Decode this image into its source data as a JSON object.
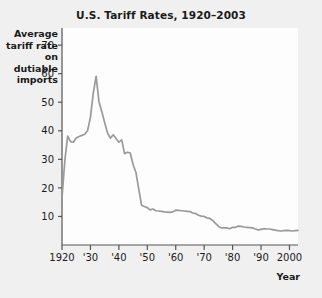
{
  "figure": {
    "background_color": "#f0f0f0",
    "plot_background_color": "#fdfdfd",
    "axis_color": "#555555",
    "line_color": "#9a9a9a"
  },
  "chart_data": {
    "type": "line",
    "title": "U.S. Tariff Rates, 1920–2003",
    "xlabel": "Year",
    "ylabel": "Average tariff rate on dutiable imports",
    "ylabel_lines": [
      "Average",
      "tariff rate",
      "on dutiable",
      "imports"
    ],
    "xlim": [
      1920,
      2003
    ],
    "ylim": [
      0,
      76
    ],
    "grid": false,
    "legend": null,
    "ytick_labels": [
      "10",
      "20",
      "30",
      "40",
      "50",
      "60",
      "70"
    ],
    "yticks": [
      10,
      20,
      30,
      40,
      50,
      60,
      70
    ],
    "xtick_labels": [
      "1920",
      "'30",
      "'40",
      "'50",
      "'60",
      "'70",
      "'80",
      "'90",
      "2000"
    ],
    "xticks": [
      1920,
      1930,
      1940,
      1950,
      1960,
      1970,
      1980,
      1990,
      2000
    ],
    "series": [
      {
        "name": "Average tariff rate on dutiable imports",
        "color": "#9a9a9a",
        "x": [
          1920,
          1921,
          1922,
          1923,
          1924,
          1925,
          1926,
          1927,
          1928,
          1929,
          1930,
          1931,
          1932,
          1933,
          1934,
          1935,
          1936,
          1937,
          1938,
          1939,
          1940,
          1941,
          1942,
          1943,
          1944,
          1945,
          1946,
          1947,
          1948,
          1949,
          1950,
          1951,
          1952,
          1953,
          1954,
          1955,
          1956,
          1957,
          1958,
          1959,
          1960,
          1961,
          1962,
          1963,
          1964,
          1965,
          1966,
          1967,
          1968,
          1969,
          1970,
          1971,
          1972,
          1973,
          1974,
          1975,
          1976,
          1977,
          1978,
          1979,
          1980,
          1981,
          1982,
          1983,
          1984,
          1985,
          1986,
          1987,
          1988,
          1989,
          1990,
          1991,
          1992,
          1993,
          1994,
          1995,
          1996,
          1997,
          1998,
          1999,
          2000,
          2001,
          2002,
          2003
        ],
        "values": [
          16.4,
          29.6,
          38.1,
          36.2,
          36.0,
          37.5,
          38.0,
          38.4,
          38.8,
          40.1,
          44.7,
          53.2,
          59.1,
          50.2,
          46.7,
          42.9,
          39.3,
          37.4,
          38.6,
          37.3,
          36.0,
          36.8,
          32.0,
          32.5,
          32.2,
          28.2,
          25.4,
          19.6,
          13.9,
          13.5,
          13.1,
          12.3,
          12.6,
          12.0,
          11.9,
          11.8,
          11.6,
          11.5,
          11.4,
          11.6,
          12.2,
          12.1,
          12.0,
          11.9,
          11.8,
          11.7,
          11.2,
          11.0,
          10.4,
          10.1,
          10.0,
          9.5,
          9.3,
          8.6,
          7.6,
          6.6,
          6.0,
          6.0,
          6.0,
          5.7,
          6.2,
          6.2,
          6.6,
          6.5,
          6.3,
          6.2,
          6.1,
          6.0,
          5.6,
          5.3,
          5.5,
          5.7,
          5.6,
          5.6,
          5.4,
          5.2,
          5.0,
          4.9,
          5.0,
          5.1,
          5.0,
          4.9,
          5.0,
          5.1
        ]
      }
    ]
  }
}
